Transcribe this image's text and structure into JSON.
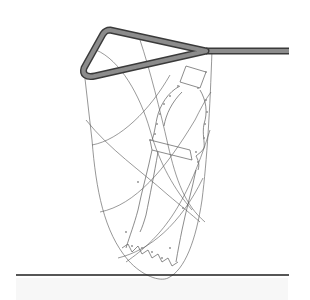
{
  "diagram": {
    "colors": {
      "background": "#ffffff",
      "handle_outer": "#3a3a3a",
      "handle_inner": "#8c8c8c",
      "grid_lines": "#555555",
      "ground_line": "#1e1e1e",
      "ground_shadow": "#f7f7f7"
    },
    "elements": [
      "triangular-handle",
      "handle-rod",
      "bag-outline",
      "curved-grid",
      "figure-outline",
      "point-labels",
      "ground-line"
    ]
  }
}
